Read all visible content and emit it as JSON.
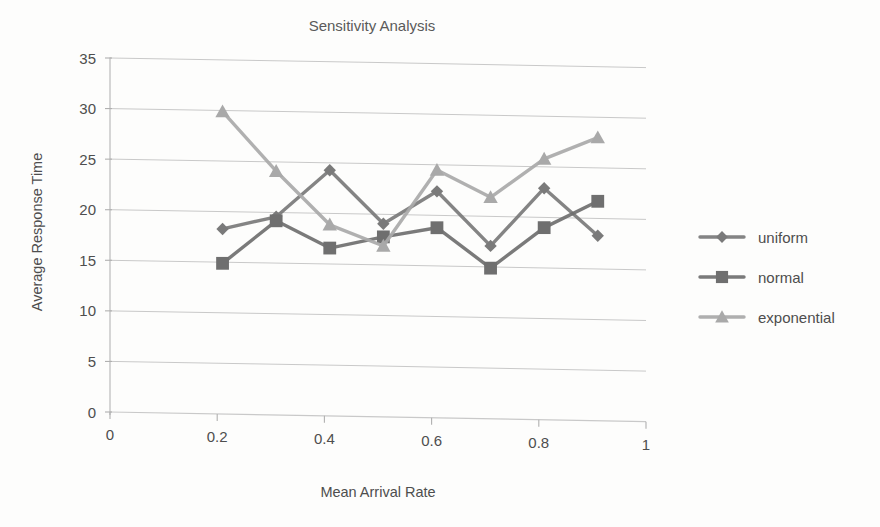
{
  "chart_data": {
    "type": "line",
    "title": "Sensitivity Analysis",
    "xlabel": "Mean Arrival Rate",
    "ylabel": "Average Response Time",
    "xlim": [
      0,
      1
    ],
    "ylim": [
      0,
      35
    ],
    "xticks": [
      "0",
      "0.2",
      "0.4",
      "0.6",
      "0.8",
      "1"
    ],
    "xtick_values": [
      0,
      0.2,
      0.4,
      0.6,
      0.8,
      1
    ],
    "yticks": [
      "0",
      "5",
      "10",
      "15",
      "20",
      "25",
      "30",
      "35"
    ],
    "ytick_values": [
      0,
      5,
      10,
      15,
      20,
      25,
      30,
      35
    ],
    "grid": true,
    "legend_position": "right",
    "x": [
      0.21,
      0.31,
      0.41,
      0.51,
      0.61,
      0.71,
      0.81,
      0.91
    ],
    "series": [
      {
        "name": "uniform",
        "marker": "diamond",
        "color": "#7a7a7a",
        "values": [
          18.3,
          19.6,
          24.3,
          19.1,
          22.4,
          17.1,
          22.9,
          18.3
        ]
      },
      {
        "name": "normal",
        "marker": "square",
        "color": "#6f6f6f",
        "values": [
          14.9,
          19.2,
          16.6,
          17.8,
          18.8,
          14.9,
          19.0,
          21.7
        ]
      },
      {
        "name": "exponential",
        "marker": "triangle",
        "color": "#a9a9a9",
        "values": [
          29.9,
          24.1,
          18.9,
          16.9,
          24.5,
          21.9,
          25.8,
          28.0
        ]
      }
    ]
  },
  "legend": {
    "items": [
      {
        "label": "uniform"
      },
      {
        "label": "normal"
      },
      {
        "label": "exponential"
      }
    ]
  },
  "colors": {
    "uniform": "#7a7a7a",
    "normal": "#6f6f6f",
    "exponential": "#a9a9a9",
    "grid": "#c9c9c9",
    "text": "#4e4e4e",
    "background": "#fdfdfc"
  }
}
